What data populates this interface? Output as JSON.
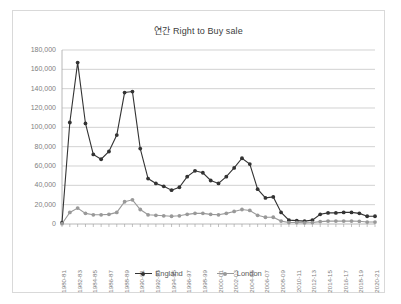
{
  "chart_data": {
    "type": "line",
    "title": "연간 Right to Buy sale",
    "xlabel": "",
    "ylabel": "",
    "ylim": [
      0,
      180000
    ],
    "ytick_labels": [
      "180,000",
      "160,000",
      "140,000",
      "120,000",
      "100,000",
      "80,000",
      "60,000",
      "40,000",
      "20,000",
      "0"
    ],
    "ytick_values": [
      180000,
      160000,
      140000,
      120000,
      100000,
      80000,
      60000,
      40000,
      20000,
      0
    ],
    "grid": true,
    "legend_position": "bottom",
    "categories": [
      "1980-81",
      "1981-82",
      "1982-83",
      "1983-84",
      "1984-85",
      "1985-86",
      "1986-87",
      "1987-88",
      "1988-89",
      "1989-90",
      "1990-91",
      "1991-92",
      "1992-93",
      "1993-94",
      "1994-95",
      "1995-96",
      "1996-97",
      "1997-98",
      "1998-99",
      "1999-00",
      "2000-01",
      "2001-02",
      "2002-03",
      "2003-04",
      "2004-05",
      "2005-06",
      "2006-07",
      "2007-08",
      "2008-09",
      "2009-10",
      "2010-11",
      "2011-12",
      "2012-13",
      "2013-14",
      "2014-15",
      "2015-16",
      "2016-17",
      "2017-18",
      "2018-19",
      "2019-20",
      "2020-21"
    ],
    "visible_xtick_labels": [
      "1980-81",
      "1982-83",
      "1984-85",
      "1986-87",
      "1988-89",
      "1990-91",
      "1992-93",
      "1994-95",
      "1996-97",
      "1998-99",
      "2000-01",
      "2002-03",
      "2004-05",
      "2006-07",
      "2008-09",
      "2010-11",
      "2012-13",
      "2014-15",
      "2016-17",
      "2018-19",
      "2020-21"
    ],
    "series": [
      {
        "name": "England",
        "color": "#333333",
        "values": [
          1500,
          105000,
          167000,
          104000,
          72000,
          67000,
          75000,
          92000,
          136000,
          137000,
          78000,
          47000,
          42000,
          39000,
          35000,
          38000,
          49000,
          55000,
          53000,
          45000,
          42000,
          49000,
          58000,
          68000,
          62000,
          36000,
          27000,
          28000,
          12000,
          4000,
          3500,
          3000,
          4000,
          10000,
          11500,
          11500,
          12000,
          12000,
          11000,
          8000,
          8000
        ]
      },
      {
        "name": "London",
        "color": "#999999",
        "values": [
          300,
          12000,
          16500,
          11000,
          9500,
          9500,
          10000,
          12000,
          23000,
          25000,
          15000,
          9500,
          9000,
          8500,
          8000,
          8500,
          10000,
          11000,
          11000,
          10000,
          9500,
          11000,
          13000,
          15000,
          14000,
          9000,
          7000,
          7000,
          3000,
          1500,
          1500,
          1200,
          1500,
          2500,
          3000,
          3000,
          3000,
          3000,
          2800,
          2000,
          2000
        ]
      }
    ]
  },
  "legend": {
    "entries": [
      {
        "label": "England"
      },
      {
        "label": "London"
      }
    ]
  },
  "colors": {
    "england": "#333333",
    "london": "#999999",
    "gridline": "#bfbfbf",
    "axis": "#a6a6a6",
    "border": "#d9d9d9",
    "text": "#808080",
    "title_text": "#404040"
  }
}
